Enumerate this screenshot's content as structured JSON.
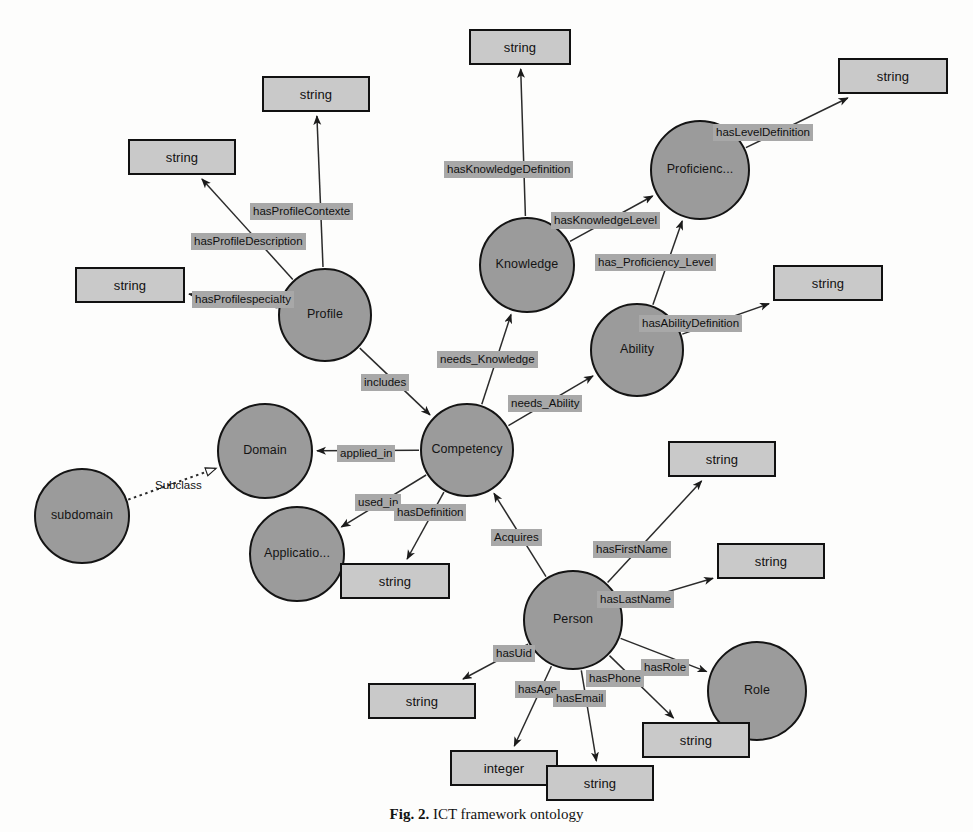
{
  "figure": {
    "caption_number": "Fig. 2.",
    "caption_text": "ICT framework ontology"
  },
  "colors": {
    "class_node_fill": "#9b9b9b",
    "class_node_stroke": "#141414",
    "datatype_box_fill": "#c9c9c9",
    "datatype_box_stroke": "#111111",
    "edge_label_bg": "#a8a8a8",
    "edge_stroke": "#2b2b2b",
    "background": "#fdfdfc"
  },
  "diagram": {
    "type": "ontology-graph",
    "class_nodes": [
      {
        "id": "profile",
        "label": "Profile",
        "cx": 325,
        "cy": 315,
        "r": 47
      },
      {
        "id": "knowledge",
        "label": "Knowledge",
        "cx": 527,
        "cy": 265,
        "r": 48
      },
      {
        "id": "proficiency",
        "label": "Proficienc...",
        "cx": 700,
        "cy": 170,
        "r": 50
      },
      {
        "id": "ability",
        "label": "Ability",
        "cx": 637,
        "cy": 350,
        "r": 47
      },
      {
        "id": "competency",
        "label": "Competency",
        "cx": 467,
        "cy": 450,
        "r": 47
      },
      {
        "id": "domain",
        "label": "Domain",
        "cx": 265,
        "cy": 451,
        "r": 48
      },
      {
        "id": "subdomain",
        "label": "subdomain",
        "cx": 82,
        "cy": 516,
        "r": 48
      },
      {
        "id": "application",
        "label": "Applicatio...",
        "cx": 297,
        "cy": 554,
        "r": 48
      },
      {
        "id": "person",
        "label": "Person",
        "cx": 573,
        "cy": 620,
        "r": 50
      },
      {
        "id": "role",
        "label": "Role",
        "cx": 757,
        "cy": 691,
        "r": 50
      }
    ],
    "datatype_boxes": [
      {
        "id": "dt_profile_contexte",
        "label": "string",
        "x": 262,
        "y": 76,
        "w": 108,
        "h": 36
      },
      {
        "id": "dt_profile_desc",
        "label": "string",
        "x": 128,
        "y": 139,
        "w": 108,
        "h": 36
      },
      {
        "id": "dt_profile_specialty",
        "label": "string",
        "x": 75,
        "y": 267,
        "w": 110,
        "h": 36
      },
      {
        "id": "dt_knowledge_def",
        "label": "string",
        "x": 469,
        "y": 29,
        "w": 102,
        "h": 36
      },
      {
        "id": "dt_level_def",
        "label": "string",
        "x": 838,
        "y": 58,
        "w": 110,
        "h": 36
      },
      {
        "id": "dt_ability_def",
        "label": "string",
        "x": 773,
        "y": 265,
        "w": 110,
        "h": 36
      },
      {
        "id": "dt_competency_def",
        "label": "string",
        "x": 340,
        "y": 563,
        "w": 110,
        "h": 36
      },
      {
        "id": "dt_first_name",
        "label": "string",
        "x": 668,
        "y": 441,
        "w": 108,
        "h": 36
      },
      {
        "id": "dt_last_name",
        "label": "string",
        "x": 717,
        "y": 543,
        "w": 108,
        "h": 36
      },
      {
        "id": "dt_uid",
        "label": "string",
        "x": 368,
        "y": 683,
        "w": 108,
        "h": 36
      },
      {
        "id": "dt_phone",
        "label": "string",
        "x": 642,
        "y": 722,
        "w": 108,
        "h": 36
      },
      {
        "id": "dt_age",
        "label": "integer",
        "x": 450,
        "y": 750,
        "w": 108,
        "h": 36
      },
      {
        "id": "dt_email",
        "label": "string",
        "x": 546,
        "y": 765,
        "w": 108,
        "h": 36
      }
    ],
    "edges": [
      {
        "id": "e_profile_contexte",
        "label": "hasProfileContexte",
        "from": "profile",
        "to": "dt_profile_contexte",
        "lx": 250,
        "ly": 203,
        "arrow": "solid"
      },
      {
        "id": "e_profile_desc",
        "label": "hasProfileDescription",
        "from": "profile",
        "to": "dt_profile_desc",
        "lx": 191,
        "ly": 233,
        "arrow": "solid"
      },
      {
        "id": "e_profile_specialty",
        "label": "hasProfilespecialty",
        "from": "profile",
        "to": "dt_profile_specialty",
        "lx": 192,
        "ly": 291,
        "arrow": "solid"
      },
      {
        "id": "e_includes",
        "label": "includes",
        "from": "profile",
        "to": "competency",
        "lx": 361,
        "ly": 374,
        "arrow": "solid"
      },
      {
        "id": "e_knowledge_def",
        "label": "hasKnowledgeDefinition",
        "from": "knowledge",
        "to": "dt_knowledge_def",
        "lx": 444,
        "ly": 161,
        "arrow": "solid"
      },
      {
        "id": "e_knowledge_level",
        "label": "hasKnowledgeLevel",
        "from": "knowledge",
        "to": "proficiency",
        "lx": 551,
        "ly": 212,
        "arrow": "solid"
      },
      {
        "id": "e_level_def",
        "label": "hasLevelDefinition",
        "from": "proficiency",
        "to": "dt_level_def",
        "lx": 713,
        "ly": 124,
        "arrow": "solid"
      },
      {
        "id": "e_proficiency_level",
        "label": "has_Proficiency_Level",
        "from": "ability",
        "to": "proficiency",
        "lx": 595,
        "ly": 254,
        "arrow": "solid"
      },
      {
        "id": "e_ability_def",
        "label": "hasAbilityDefinition",
        "from": "ability",
        "to": "dt_ability_def",
        "lx": 639,
        "ly": 315,
        "arrow": "solid"
      },
      {
        "id": "e_needs_knowledge",
        "label": "needs_Knowledge",
        "from": "competency",
        "to": "knowledge",
        "lx": 437,
        "ly": 351,
        "arrow": "solid"
      },
      {
        "id": "e_needs_ability",
        "label": "needs_Ability",
        "from": "competency",
        "to": "ability",
        "lx": 508,
        "ly": 395,
        "arrow": "solid"
      },
      {
        "id": "e_applied_in",
        "label": "applied_in",
        "from": "competency",
        "to": "domain",
        "lx": 337,
        "ly": 445,
        "arrow": "solid"
      },
      {
        "id": "e_used_in",
        "label": "used_in",
        "from": "competency",
        "to": "application",
        "lx": 355,
        "ly": 494,
        "arrow": "solid"
      },
      {
        "id": "e_has_definition",
        "label": "hasDefinition",
        "from": "competency",
        "to": "dt_competency_def",
        "lx": 394,
        "ly": 504,
        "arrow": "solid"
      },
      {
        "id": "e_subclass",
        "label": "Subclass",
        "from": "subdomain",
        "to": "domain",
        "lx": 152,
        "ly": 477,
        "arrow": "hollow",
        "style": "dotted",
        "plain_label": true
      },
      {
        "id": "e_acquires",
        "label": "Acquires",
        "from": "person",
        "to": "competency",
        "lx": 491,
        "ly": 529,
        "arrow": "solid"
      },
      {
        "id": "e_first_name",
        "label": "hasFirstName",
        "from": "person",
        "to": "dt_first_name",
        "lx": 593,
        "ly": 541,
        "arrow": "solid"
      },
      {
        "id": "e_last_name",
        "label": "hasLastName",
        "from": "person",
        "to": "dt_last_name",
        "lx": 597,
        "ly": 591,
        "arrow": "solid"
      },
      {
        "id": "e_uid",
        "label": "hasUid",
        "from": "person",
        "to": "dt_uid",
        "lx": 493,
        "ly": 645,
        "arrow": "solid"
      },
      {
        "id": "e_role",
        "label": "hasRole",
        "from": "person",
        "to": "role",
        "lx": 641,
        "ly": 659,
        "arrow": "solid"
      },
      {
        "id": "e_phone",
        "label": "hasPhone",
        "from": "person",
        "to": "dt_phone",
        "lx": 586,
        "ly": 670,
        "arrow": "solid"
      },
      {
        "id": "e_age",
        "label": "hasAge",
        "from": "person",
        "to": "dt_age",
        "lx": 515,
        "ly": 681,
        "arrow": "solid"
      },
      {
        "id": "e_email",
        "label": "hasEmail",
        "from": "person",
        "to": "dt_email",
        "lx": 553,
        "ly": 690,
        "arrow": "solid"
      }
    ]
  }
}
